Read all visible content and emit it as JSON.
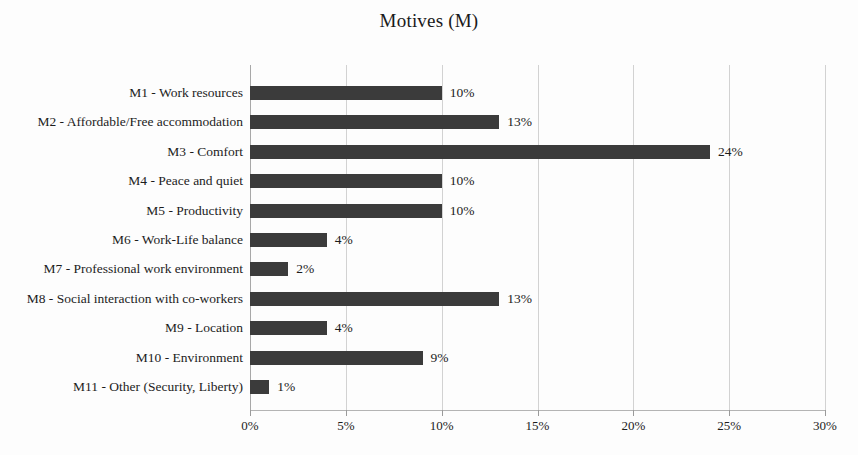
{
  "chart_data": {
    "type": "bar",
    "orientation": "horizontal",
    "title": "Motives (M)",
    "xlabel": "",
    "ylabel": "",
    "xlim": [
      0,
      30
    ],
    "xticks": [
      "0%",
      "5%",
      "10%",
      "15%",
      "20%",
      "25%",
      "30%"
    ],
    "xtick_values": [
      0,
      5,
      10,
      15,
      20,
      25,
      30
    ],
    "grid": true,
    "grid_axis": "x",
    "legend": false,
    "bar_color": "#3b3b3b",
    "categories": [
      "M1 - Work resources",
      "M2 - Affordable/Free accommodation",
      "M3 - Comfort",
      "M4 - Peace and quiet",
      "M5 - Productivity",
      "M6 - Work-Life balance",
      "M7 - Professional work environment",
      "M8 - Social interaction with co-workers",
      "M9 - Location",
      "M10 - Environment",
      "M11 - Other (Security, Liberty)"
    ],
    "values": [
      10,
      13,
      24,
      10,
      10,
      4,
      2,
      13,
      4,
      9,
      1
    ],
    "data_labels": [
      "10%",
      "13%",
      "24%",
      "10%",
      "10%",
      "4%",
      "2%",
      "13%",
      "4%",
      "9%",
      "1%"
    ]
  }
}
